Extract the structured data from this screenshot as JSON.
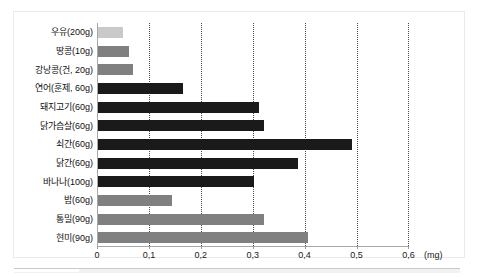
{
  "chart": {
    "type": "bar",
    "orientation": "horizontal",
    "title": "",
    "unit_label": "(mg)",
    "x_tick_labels": [
      "0",
      "0,1",
      "0,2",
      "0,3",
      "0,4",
      "0,5",
      "0,6"
    ],
    "x_tick_values": [
      0,
      0.1,
      0.2,
      0.3,
      0.4,
      0.5,
      0.6
    ]
  },
  "chart_data": {
    "type": "bar",
    "orientation": "horizontal",
    "title": "",
    "xlabel": "(mg)",
    "ylabel": "",
    "xlim": [
      0,
      0.62
    ],
    "grid": true,
    "legend": "none",
    "categories": [
      "우유(200g)",
      "땅콩(10g)",
      "강낭콩(건, 20g)",
      "연어(훈제, 60g)",
      "돼지고기(60g)",
      "닭가슴살(60g)",
      "쇠간(60g)",
      "닭간(60g)",
      "바나나(100g)",
      "밤(60g)",
      "통밀(90g)",
      "현미(90g)"
    ],
    "values": [
      0.048,
      0.06,
      0.068,
      0.163,
      0.31,
      0.32,
      0.49,
      0.385,
      0.3,
      0.142,
      0.32,
      0.405
    ],
    "bar_colors": [
      "#c9c9c9",
      "#808080",
      "#808080",
      "#1a1a1a",
      "#1a1a1a",
      "#1a1a1a",
      "#1a1a1a",
      "#1a1a1a",
      "#1a1a1a",
      "#808080",
      "#808080",
      "#808080"
    ],
    "xticks": [
      0,
      0.1,
      0.2,
      0.3,
      0.4,
      0.5,
      0.6
    ],
    "xticklabels": [
      "0",
      "0,1",
      "0,2",
      "0,3",
      "0,4",
      "0,5",
      "0,6"
    ]
  },
  "colors": {
    "bar_light": "#c9c9c9",
    "bar_mid": "#808080",
    "bar_dark": "#1a1a1a",
    "gridline": "#4a4a4a",
    "axis": "#a8a8a8",
    "frame": "#e9eaec",
    "text": "#111111",
    "background": "#ffffff"
  }
}
